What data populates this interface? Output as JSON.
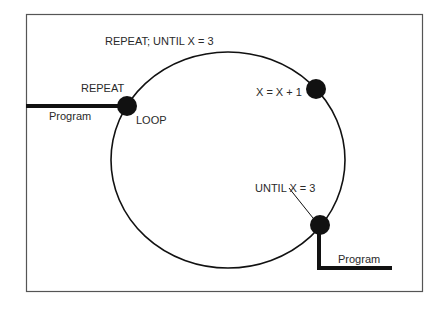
{
  "diagram": {
    "title": "REPEAT; UNTIL X = 3",
    "nodes": [
      {
        "id": "loop",
        "label_top": "REPEAT",
        "label_bottom": "LOOP"
      },
      {
        "id": "increment",
        "label": "X = X + 1"
      },
      {
        "id": "until",
        "label": "UNTIL X = 3"
      }
    ],
    "program_in_label": "Program",
    "program_out_label": "Program",
    "colors": {
      "stroke": "#111111",
      "frame": "#555555",
      "text": "#2a2a2a"
    }
  }
}
